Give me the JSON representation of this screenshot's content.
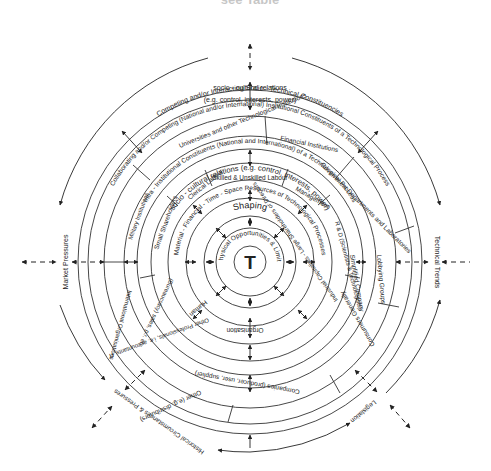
{
  "diagram": {
    "title_fragment": "see Table",
    "center": "T",
    "rings": {
      "r1": "Physical Opportunities & Limits",
      "r2_top": "Shaping",
      "r3": "Material - Financial - Time - Space Resources of Technological Processes",
      "r4_human": "Human",
      "r4_org": "Organisation",
      "r5": "socio - cultural relations (e.g. control, interests, power)",
      "r6_ring": "Intra - Institutional Constituents (National and International) of a Technological Process",
      "r6_sectors": [
        "Skilled & Unskilled Labour",
        "Management",
        "R & D (Scientists & Technologists)",
        "Industrial Capitalists - Large Shareholders or Directors",
        "Other Professionals, i.e. accountants, IT",
        "(Bureaucracy) sales, p.r. etc.",
        "Small Shareholders",
        "Clerical Labour"
      ],
      "r6_right": "Simplified Company",
      "r7_ring": "Collaborating and/or Competing (National and/or International) Institutional Constituents of a Technological Process",
      "r7_sectors": [
        "Universities and other Technological Institutions",
        "Financial Institutions",
        "Government Departments and Laboratories",
        "Lobbying Groups",
        "Consumers Generally",
        "Companies (producer, user, supplier)",
        "Other (e.g. distributors)",
        "International Organisations",
        "Military Institutions"
      ],
      "outer_ring": "Competing and/or Interacting Socio - Technical Constituencies",
      "outer_relations": "socio - cultural relations",
      "outer_relations_eg": "(e.g. control, interests, power)"
    },
    "external_forces": {
      "left": "Market Pressures",
      "right": "Technical Trends",
      "bottom_left": "Historical Circumstances & Pressures",
      "bottom_right": "Legislation"
    }
  }
}
